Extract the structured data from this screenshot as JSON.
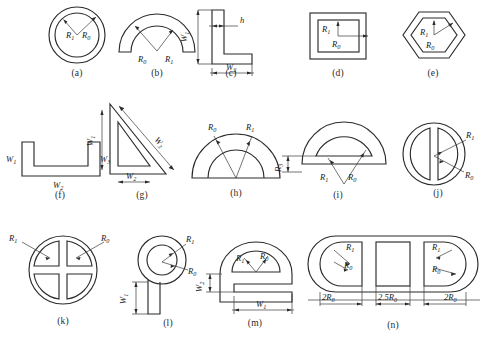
{
  "figure": {
    "title": "",
    "kind": "cross-section-shape-catalog",
    "panel_count": 14,
    "row_layout": [
      5,
      5,
      4
    ]
  },
  "symbols": {
    "R0": "R₀",
    "R1": "R₁",
    "R3": "R₃",
    "W1": "W₁",
    "W2": "W₂",
    "W3": "W₃",
    "h": "h",
    "two_R0": "2R₀",
    "two_point_five_R0": "2.5R₀"
  },
  "panels": [
    {
      "id": "a",
      "caption": "(a)",
      "shape": "circular-annulus",
      "labels": [
        "R₁",
        "R₀"
      ]
    },
    {
      "id": "b",
      "caption": "(b)",
      "shape": "semicircular-arc-band",
      "labels": [
        "R₀",
        "R₁"
      ]
    },
    {
      "id": "c",
      "caption": "(c)",
      "shape": "angle-L-section",
      "labels": [
        "W₁",
        "W₂",
        "h"
      ]
    },
    {
      "id": "d",
      "caption": "(d)",
      "shape": "square-annulus",
      "labels": [
        "R₁",
        "R₀"
      ]
    },
    {
      "id": "e",
      "caption": "(e)",
      "shape": "hexagonal-annulus",
      "labels": [
        "R₁",
        "R₀"
      ]
    },
    {
      "id": "f",
      "caption": "(f)",
      "shape": "channel-U-section",
      "labels": [
        "W₁",
        "W₂",
        "W₃"
      ]
    },
    {
      "id": "g",
      "caption": "(g)",
      "shape": "triangular-tube-section",
      "labels": [
        "W₁",
        "W₂",
        "W₃"
      ]
    },
    {
      "id": "h",
      "caption": "(h)",
      "shape": "half-disc-with-semicircular-cut",
      "labels": [
        "R₀",
        "R₁"
      ]
    },
    {
      "id": "i",
      "caption": "(i)",
      "shape": "half-disc-with-flat-chord-cut",
      "labels": [
        "R₃",
        "R₁",
        "R₀"
      ]
    },
    {
      "id": "j",
      "caption": "(j)",
      "shape": "disc-with-two-d-slots",
      "labels": [
        "R₁",
        "R₀"
      ]
    },
    {
      "id": "k",
      "caption": "(k)",
      "shape": "disc-with-four-quadrant-cuts",
      "labels": [
        "R₁",
        "R₀"
      ]
    },
    {
      "id": "l",
      "caption": "(l)",
      "shape": "ring-with-stem",
      "labels": [
        "R₁",
        "R₀",
        "W₁"
      ]
    },
    {
      "id": "m",
      "caption": "(m)",
      "shape": "domed-e-section",
      "labels": [
        "R₁",
        "R₀",
        "W₂",
        "W₁"
      ]
    },
    {
      "id": "n",
      "caption": "(n)",
      "shape": "stadium-with-three-cuts",
      "labels": [
        "R₁",
        "R₀",
        "R₁",
        "R₀",
        "2R₀",
        "2.5R₀",
        "2R₀"
      ]
    }
  ]
}
